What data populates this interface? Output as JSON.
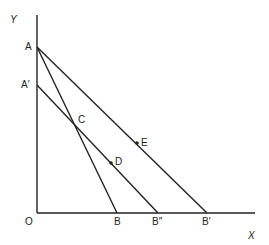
{
  "diagram": {
    "axes": {
      "y_label": "Y",
      "x_label": "X",
      "origin_label": "O"
    },
    "points": {
      "A": "A",
      "A_prime": "A′",
      "C": "C",
      "D": "D",
      "E": "E",
      "B": "B",
      "B_double_prime": "B″",
      "B_prime": "B′"
    },
    "lines": [
      {
        "from": "A",
        "to": "B"
      },
      {
        "from": "A",
        "to": "B′"
      },
      {
        "from": "A′",
        "to": "B″"
      }
    ],
    "marked_points": [
      "D",
      "E"
    ]
  }
}
